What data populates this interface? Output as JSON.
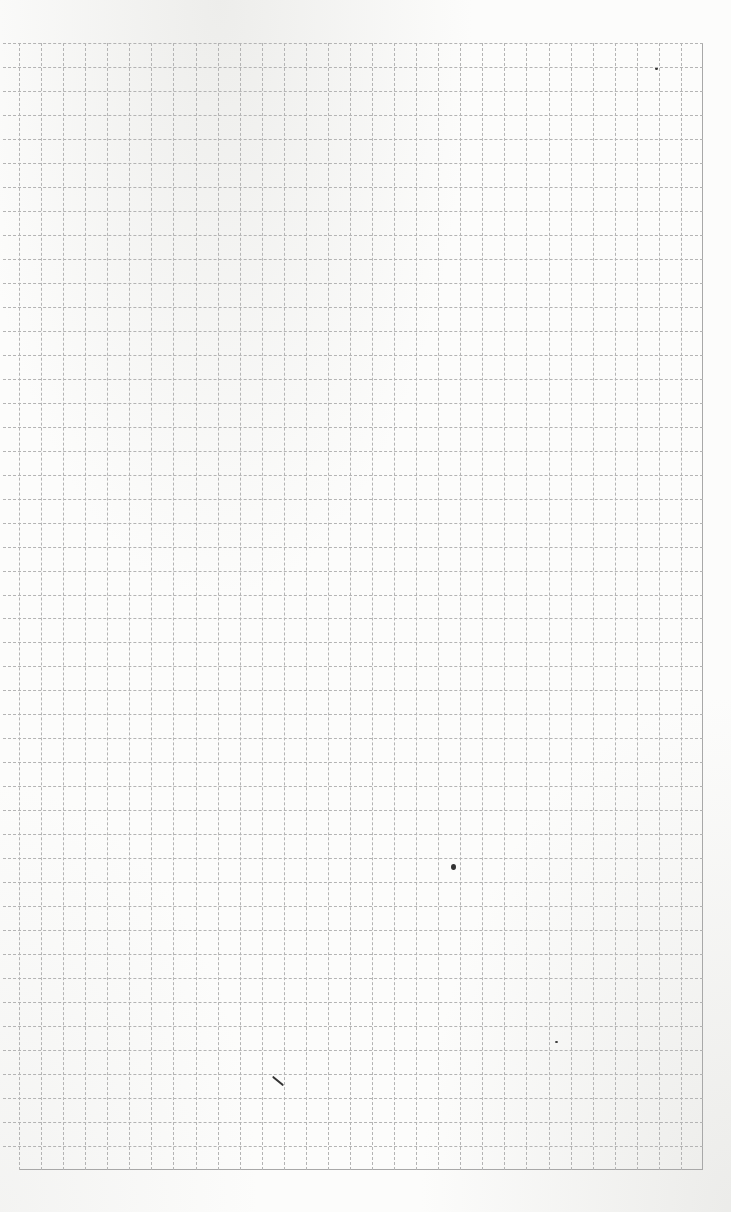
{
  "page": {
    "type": "graph-paper-sheet",
    "background_color": "#fcfcfb",
    "line_color": "#b4b4b4",
    "edge_color": "#a8a8a8"
  },
  "grid": {
    "left": 19,
    "top": 43,
    "right": 703,
    "bottom": 1170,
    "columns": 31,
    "rows": 47,
    "cell_width": 22.06,
    "cell_height": 23.98,
    "left_line_overhang": 16
  },
  "marks": [
    {
      "name": "speck-top-right",
      "x": 655,
      "y": 67,
      "w": 3,
      "h": 3
    },
    {
      "name": "blot-center",
      "x": 451,
      "y": 864,
      "w": 5,
      "h": 6
    },
    {
      "name": "speck-lower-right",
      "x": 555,
      "y": 1041,
      "w": 3,
      "h": 2
    },
    {
      "name": "pencil-stroke",
      "x": 271,
      "y": 1080,
      "w": 14,
      "h": 2,
      "rotate": 40
    }
  ]
}
